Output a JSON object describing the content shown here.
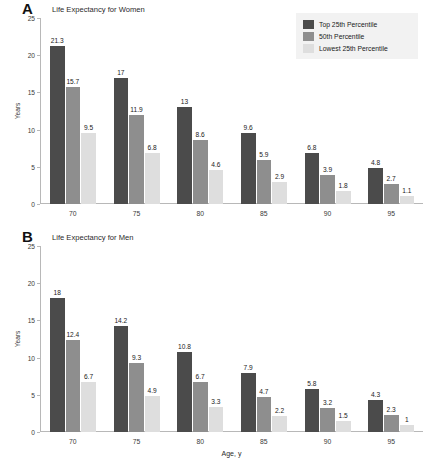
{
  "figure": {
    "background": "#ffffff",
    "series_colors": [
      "#4b4b4b",
      "#8e8e8e",
      "#dedede"
    ],
    "legend": {
      "background": "#f2f2f2",
      "items": [
        {
          "label": "Top 25th Percentile",
          "color": "#4b4b4b"
        },
        {
          "label": "50th Percentile",
          "color": "#8e8e8e"
        },
        {
          "label": "Lowest 25th Percentile",
          "color": "#dedede"
        }
      ]
    }
  },
  "panels": [
    {
      "letter": "A",
      "title": "Life Expectancy for Women"
    },
    {
      "letter": "B",
      "title": "Life Expectancy for Men"
    }
  ],
  "chart_data": [
    {
      "type": "bar",
      "panel": "A",
      "title": "Life Expectancy for Women",
      "xlabel": "",
      "ylabel": "Years",
      "categories": [
        "70",
        "75",
        "80",
        "85",
        "90",
        "95"
      ],
      "yticks": [
        "0",
        "5",
        "10",
        "15",
        "20",
        "25"
      ],
      "ylim": [
        0,
        25
      ],
      "grid": false,
      "legend_position": "top-right",
      "series": [
        {
          "name": "Top 25th Percentile",
          "color": "#4b4b4b",
          "values": [
            21.3,
            17,
            13,
            9.6,
            6.8,
            4.8
          ],
          "labels": [
            "21.3",
            "17",
            "13",
            "9.6",
            "6.8",
            "4.8"
          ]
        },
        {
          "name": "50th Percentile",
          "color": "#8e8e8e",
          "values": [
            15.7,
            11.9,
            8.6,
            5.9,
            3.9,
            2.7
          ],
          "labels": [
            "15.7",
            "11.9",
            "8.6",
            "5.9",
            "3.9",
            "2.7"
          ]
        },
        {
          "name": "Lowest 25th Percentile",
          "color": "#dedede",
          "values": [
            9.5,
            6.8,
            4.6,
            2.9,
            1.8,
            1.1
          ],
          "labels": [
            "9.5",
            "6.8",
            "4.6",
            "2.9",
            "1.8",
            "1.1"
          ]
        }
      ]
    },
    {
      "type": "bar",
      "panel": "B",
      "title": "Life Expectancy for Men",
      "xlabel": "Age, y",
      "ylabel": "Years",
      "categories": [
        "70",
        "75",
        "80",
        "85",
        "90",
        "95"
      ],
      "yticks": [
        "0",
        "5",
        "10",
        "15",
        "20",
        "25"
      ],
      "ylim": [
        0,
        25
      ],
      "grid": false,
      "legend_position": "none",
      "series": [
        {
          "name": "Top 25th Percentile",
          "color": "#4b4b4b",
          "values": [
            18,
            14.2,
            10.8,
            7.9,
            5.8,
            4.3
          ],
          "labels": [
            "18",
            "14.2",
            "10.8",
            "7.9",
            "5.8",
            "4.3"
          ]
        },
        {
          "name": "50th Percentile",
          "color": "#8e8e8e",
          "values": [
            12.4,
            9.3,
            6.7,
            4.7,
            3.2,
            2.3
          ],
          "labels": [
            "12.4",
            "9.3",
            "6.7",
            "4.7",
            "3.2",
            "2.3"
          ]
        },
        {
          "name": "Lowest 25th Percentile",
          "color": "#dedede",
          "values": [
            6.7,
            4.9,
            3.3,
            2.2,
            1.5,
            1
          ],
          "labels": [
            "6.7",
            "4.9",
            "3.3",
            "2.2",
            "1.5",
            "1"
          ]
        }
      ]
    }
  ]
}
